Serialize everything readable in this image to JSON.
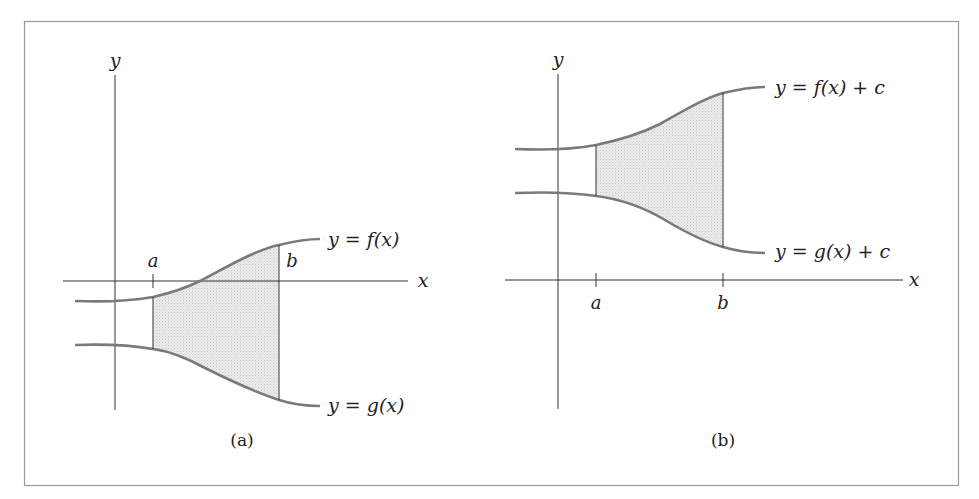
{
  "figure": {
    "border_color": "#9a9a9a",
    "curve_color": "#7a7a7a",
    "axis_color": "#333333",
    "fill_color": "#e4e4e4"
  },
  "panel_a": {
    "caption": "(a)",
    "y_axis_label": "y",
    "x_axis_label": "x",
    "tick_a": "a",
    "tick_b": "b",
    "upper_curve_label": "y = f(x)",
    "lower_curve_label": "y = g(x)"
  },
  "panel_b": {
    "caption": "(b)",
    "y_axis_label": "y",
    "x_axis_label": "x",
    "tick_a": "a",
    "tick_b": "b",
    "upper_curve_label": "y = f(x) + c",
    "lower_curve_label": "y = g(x) + c"
  }
}
